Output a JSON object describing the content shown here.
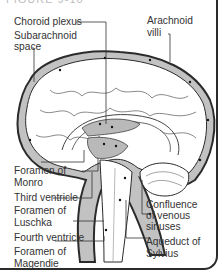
{
  "figure": {
    "title_fragment": "FIGURE 9-10"
  },
  "labels": {
    "choroid_plexus": "Choroid plexus",
    "subarachnoid_space_line1": "Subarachnoid",
    "subarachnoid_space_line2": "space",
    "arachnoid_villi_line1": "Arachnoid",
    "arachnoid_villi_line2": "villi",
    "foramen_monro_line1": "Foramen of",
    "foramen_monro_line2": "Monro",
    "third_ventricle": "Third ventricle",
    "foramen_luschka_line1": "Foramen of",
    "foramen_luschka_line2": "Luschka",
    "fourth_ventricle": "Fourth ventricle",
    "foramen_magendie_line1": "Foramen of",
    "foramen_magendie_line2": "Magendie",
    "confluence_line1": "Confluence",
    "confluence_line2": "of venous",
    "confluence_line3": "sinuses",
    "aqueduct_line1": "Aqueduct of",
    "aqueduct_line2": "Sylvius"
  },
  "colors": {
    "outline": "#2b2b2b",
    "csf_fill": "#b9b9b9",
    "brain_fill": "#ffffff",
    "leader_line": "#333333"
  }
}
